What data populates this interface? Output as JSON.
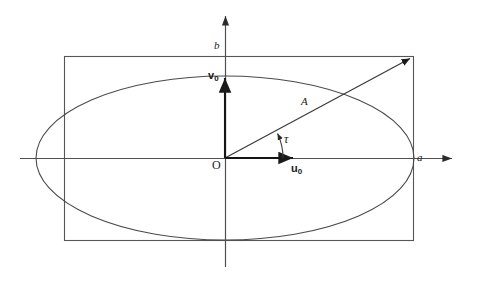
{
  "figure": {
    "kind": "geometry-diagram",
    "background_color": "#ffffff",
    "stroke_color": "#4a4a4a",
    "text_color": "#1a1a1a"
  },
  "labels": {
    "semi_minor_axis": "b",
    "semi_major_axis": "a",
    "origin": "O",
    "amplitude_vector": "A",
    "angle": "τ",
    "unit_vector_x": "u",
    "unit_vector_x_sub": "0",
    "unit_vector_y": "v",
    "unit_vector_y_sub": "0"
  },
  "geometry": {
    "origin_px": {
      "x": 225,
      "y": 158
    },
    "ellipse": {
      "cx": 225,
      "cy": 158,
      "rx": 189,
      "ry": 82
    },
    "rectangle": {
      "x": 64,
      "y": 56,
      "width": 349,
      "height": 184
    },
    "x_axis": {
      "x1": 20,
      "y1": 158,
      "x2": 458,
      "y2": 158
    },
    "y_axis": {
      "x1": 225,
      "y1": 267,
      "x2": 225,
      "y2": 10
    },
    "amplitude_arrow": {
      "x1": 225,
      "y1": 158,
      "x2": 413,
      "y2": 57
    },
    "angle_arc_degrees": 28.2,
    "unit_vector_x_arrow": {
      "x1": 225,
      "y1": 158,
      "x2": 297,
      "y2": 158
    },
    "unit_vector_y_arrow": {
      "x1": 225,
      "y1": 158,
      "x2": 225,
      "y2": 74
    }
  }
}
